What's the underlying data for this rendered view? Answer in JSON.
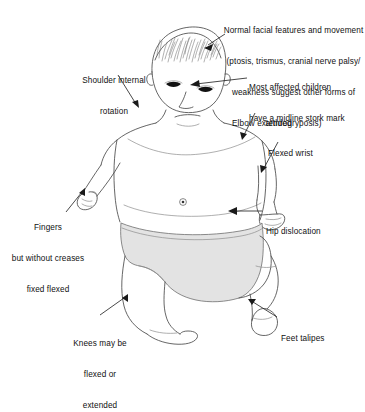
{
  "illustration": {
    "title": "Infant clinical features diagram",
    "subject": "neonate-figure",
    "background_color": "#ffffff",
    "line_color": "#4a4a4a",
    "diaper_fill": "#e3e3e3",
    "eye_color": "#111111",
    "leader_color": "#1a1a1a"
  },
  "annotations": [
    {
      "id": "facial-features",
      "lines": [
        "Normal facial features and movement",
        "(ptosis, trismus, cranial nerve palsy/",
        "weakness suggest other forms of",
        "arthrogryposis)"
      ],
      "align": "center",
      "target": "head-crown"
    },
    {
      "id": "shoulder-internal-rotation",
      "lines": [
        "Shoulder internal",
        "rotation"
      ],
      "align": "center",
      "target": "left-shoulder"
    },
    {
      "id": "stork-mark",
      "lines": [
        "Most affected children",
        "have a midline stork mark"
      ],
      "align": "left",
      "target": "glabella-midline"
    },
    {
      "id": "elbow-extended",
      "lines": [
        "Elbow extended"
      ],
      "align": "left",
      "target": "right-elbow"
    },
    {
      "id": "flexed-wrist",
      "lines": [
        "Flexed wrist"
      ],
      "align": "left",
      "target": "right-wrist"
    },
    {
      "id": "hip-dislocation",
      "lines": [
        "Hip dislocation"
      ],
      "align": "left",
      "target": "right-hip"
    },
    {
      "id": "fingers-fixed-flexed",
      "lines": [
        "Fingers",
        "but without creases",
        "fixed flexed"
      ],
      "align": "center",
      "target": "left-hand"
    },
    {
      "id": "knees",
      "lines": [
        "Knees may be",
        "flexed or",
        "extended"
      ],
      "align": "center",
      "target": "left-knee"
    },
    {
      "id": "feet-talipes",
      "lines": [
        "Feet talipes"
      ],
      "align": "left",
      "target": "right-foot"
    }
  ]
}
